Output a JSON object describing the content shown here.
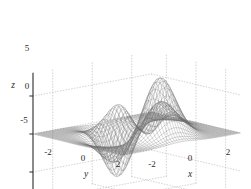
{
  "figure": {
    "type": "3d-surface-mesh-plot",
    "width": 251,
    "height": 189,
    "background_color": "#ffffff",
    "mesh_color": "#6e6e6e",
    "axis_color": "#2b2b2b",
    "grid_color": "#b4b4b4",
    "grid_style": "dotted"
  },
  "chart_data": {
    "type": "surface",
    "title": "",
    "subtitle": "",
    "function": "peaks",
    "formula": "z = 3*(1-x)^2*exp(-x^2-(y+1)^2) - 10*(x/5-x^3-y^5)*exp(-x^2-y^2) - (1/3)*exp(-(x+1)^2-y^2)",
    "render_style": "wireframe mesh",
    "projection": "3d perspective, elevation ~30deg, azimuth ~-37.5deg",
    "xlabel": "x",
    "ylabel": "y",
    "zlabel": "z",
    "xlim": [
      -3,
      3
    ],
    "ylim": [
      -3,
      3
    ],
    "zlim": [
      -8,
      8
    ],
    "xticks": [
      -2,
      0,
      2
    ],
    "yticks": [
      -2,
      0,
      2
    ],
    "zticks": [
      -5,
      0,
      5
    ],
    "xtick_labels": [
      "-2",
      "0",
      "2"
    ],
    "ytick_labels": [
      "-2",
      "0",
      "2"
    ],
    "ztick_labels": [
      "-5",
      "0",
      "5"
    ],
    "grid": true,
    "legend": false,
    "grid_resolution": 49,
    "z_max": 8.1,
    "z_min": -6.5,
    "features": [
      {
        "name": "primary peak",
        "x": -0.01,
        "y": 1.58,
        "z": 8.1
      },
      {
        "name": "secondary peak",
        "x": 1.3,
        "y": -0.0,
        "z": 3.78
      },
      {
        "name": "deep valley",
        "x": 0.23,
        "y": -1.63,
        "z": -6.55
      },
      {
        "name": "shallow dip",
        "x": -1.33,
        "y": -0.0,
        "z": -3.05
      }
    ]
  },
  "axes": {
    "x_title": "x",
    "y_title": "y",
    "z_title": "z",
    "x_tick_labels": [
      "-2",
      "0",
      "2"
    ],
    "y_tick_labels": [
      "-2",
      "0",
      "2"
    ],
    "z_tick_labels": [
      "5",
      "0",
      "-5"
    ]
  }
}
